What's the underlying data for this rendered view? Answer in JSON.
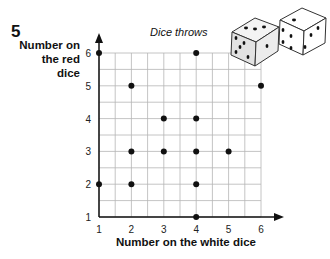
{
  "question_number": "5",
  "chart_data": {
    "type": "scatter",
    "title": "Dice throws",
    "xlabel": "Number on the white dice",
    "ylabel": "Number on the red dice",
    "xlim": [
      1,
      6
    ],
    "ylim": [
      1,
      6
    ],
    "x_ticks": [
      "1",
      "2",
      "3",
      "4",
      "5",
      "6"
    ],
    "y_ticks": [
      "1",
      "2",
      "3",
      "4",
      "5",
      "6"
    ],
    "grid": true,
    "grid_minor_step": 0.5,
    "legend": null,
    "points": [
      {
        "x": 1,
        "y": 6
      },
      {
        "x": 4,
        "y": 6
      },
      {
        "x": 2,
        "y": 5
      },
      {
        "x": 6,
        "y": 5
      },
      {
        "x": 3,
        "y": 4
      },
      {
        "x": 4,
        "y": 4
      },
      {
        "x": 2,
        "y": 3
      },
      {
        "x": 3,
        "y": 3
      },
      {
        "x": 4,
        "y": 3
      },
      {
        "x": 5,
        "y": 3
      },
      {
        "x": 1,
        "y": 2
      },
      {
        "x": 2,
        "y": 2
      },
      {
        "x": 4,
        "y": 2
      },
      {
        "x": 4,
        "y": 1
      }
    ],
    "decoration": "two-dice-illustration",
    "colors": {
      "point": "#111111",
      "grid": "#b5b5b5",
      "axis": "#111111",
      "red_dice_face": "#e2e2e2",
      "white_dice_face": "#ffffff"
    }
  }
}
